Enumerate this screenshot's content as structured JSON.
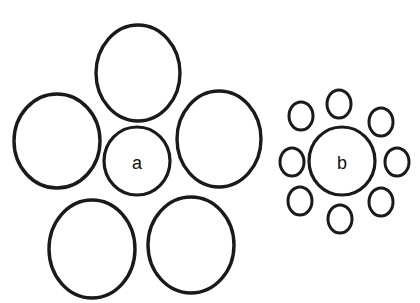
{
  "figure": {
    "name": "ebbinghaus-illusion",
    "background_color": "#ffffff",
    "stroke_color": "#1a1a1a",
    "label_color": "#111111",
    "canvas": {
      "width": 420,
      "height": 303
    },
    "top_crop_remnant": "bb"
  },
  "panels": [
    {
      "id": "panel-a",
      "label": "a",
      "label_position": {
        "x": 137,
        "y": 163
      },
      "label_font_size": 18,
      "target": {
        "name": "target-circle-a",
        "cx": 137,
        "cy": 161,
        "rx": 33,
        "ry": 34,
        "stroke_width": 3.2
      },
      "inducer_count": 5,
      "inducer_size": "large",
      "inducers": [
        {
          "name": "inducer-a-top",
          "cx": 138,
          "cy": 73,
          "rx": 42,
          "ry": 48,
          "stroke_width": 3.4
        },
        {
          "name": "inducer-a-left",
          "cx": 57,
          "cy": 141,
          "rx": 43,
          "ry": 47,
          "stroke_width": 3.4
        },
        {
          "name": "inducer-a-right",
          "cx": 219,
          "cy": 139,
          "rx": 42,
          "ry": 48,
          "stroke_width": 3.4
        },
        {
          "name": "inducer-a-bottom-left",
          "cx": 92,
          "cy": 249,
          "rx": 43,
          "ry": 49,
          "stroke_width": 3.4
        },
        {
          "name": "inducer-a-bottom-right",
          "cx": 191,
          "cy": 245,
          "rx": 43,
          "ry": 48,
          "stroke_width": 3.4
        }
      ]
    },
    {
      "id": "panel-b",
      "label": "b",
      "label_position": {
        "x": 342,
        "y": 163
      },
      "label_font_size": 18,
      "target": {
        "name": "target-circle-b",
        "cx": 342,
        "cy": 161,
        "rx": 33,
        "ry": 34,
        "stroke_width": 3.2
      },
      "inducer_count": 8,
      "inducer_size": "small",
      "inducers": [
        {
          "name": "inducer-b-n",
          "cx": 339,
          "cy": 104,
          "rx": 12,
          "ry": 14,
          "stroke_width": 3.0
        },
        {
          "name": "inducer-b-ne",
          "cx": 381,
          "cy": 122,
          "rx": 12,
          "ry": 14,
          "stroke_width": 3.0
        },
        {
          "name": "inducer-b-e",
          "cx": 397,
          "cy": 162,
          "rx": 12,
          "ry": 14,
          "stroke_width": 3.0
        },
        {
          "name": "inducer-b-se",
          "cx": 381,
          "cy": 202,
          "rx": 12,
          "ry": 14,
          "stroke_width": 3.0
        },
        {
          "name": "inducer-b-s",
          "cx": 340,
          "cy": 219,
          "rx": 12,
          "ry": 14,
          "stroke_width": 3.0
        },
        {
          "name": "inducer-b-sw",
          "cx": 300,
          "cy": 201,
          "rx": 12,
          "ry": 14,
          "stroke_width": 3.0
        },
        {
          "name": "inducer-b-w",
          "cx": 292,
          "cy": 162,
          "rx": 12,
          "ry": 14,
          "stroke_width": 3.0
        },
        {
          "name": "inducer-b-nw",
          "cx": 301,
          "cy": 116,
          "rx": 12,
          "ry": 14,
          "stroke_width": 3.0
        }
      ]
    }
  ]
}
